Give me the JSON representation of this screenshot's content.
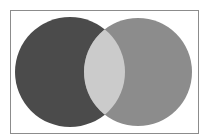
{
  "diagram": {
    "type": "venn",
    "frame": {
      "x": 10,
      "y": 10,
      "width": 188,
      "height": 123,
      "stroke": "#8c8c8c",
      "fill": "#ffffff"
    },
    "sets": [
      {
        "id": "left",
        "cx": 70,
        "cy": 72,
        "r": 55,
        "fill": "#4b4b4b"
      },
      {
        "id": "right",
        "cx": 138,
        "cy": 72,
        "r": 54,
        "fill": "#8c8c8c"
      }
    ],
    "intersection": {
      "fill": "#cbcbcb"
    }
  }
}
